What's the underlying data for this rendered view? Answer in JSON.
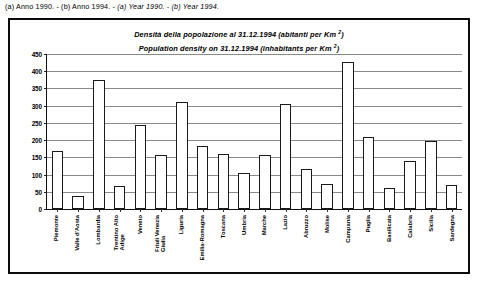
{
  "caption": {
    "roman_part": "(a) Anno 1990. - (b) Anno 1994. - ",
    "italic_part": "(a) Year 1990. - (b) Year 1994."
  },
  "chart_data": {
    "type": "bar",
    "title_it": "Densità della popolazione al 31.12.1994 (abitanti per Km ²)",
    "title_en": "Population density on 31.12.1994 (inhabitants per Km ²)",
    "xlabel": "",
    "ylabel": "",
    "ylim": [
      0,
      450
    ],
    "ytick_step": 50,
    "grid": true,
    "legend_position": "none",
    "ytick_labels": [
      "450",
      "400",
      "350",
      "300",
      "250",
      "200",
      "150",
      "100",
      "50",
      "0"
    ],
    "categories": [
      "Piemonte",
      "Valle d'Aosta",
      "Lombardia",
      "Trentino Alto\nAdige",
      "Veneto",
      "Friuli Venezia\nGiulia",
      "Liguria",
      "Emilia-Romagna",
      "Toscana",
      "Umbria",
      "Marche",
      "Lazio",
      "Abruzzo",
      "Molise",
      "Campania",
      "Puglia",
      "Basilicata",
      "Calabria",
      "Sicilia",
      "Sardegna"
    ],
    "values": [
      168,
      38,
      375,
      68,
      244,
      156,
      312,
      182,
      159,
      106,
      156,
      305,
      117,
      74,
      428,
      208,
      61,
      138,
      198,
      69
    ]
  },
  "colors": {
    "frame": "#0b0b0b",
    "bar_fill": "#ffffff",
    "bar_stroke": "#1a1a1a",
    "grid": "#8a8a8a",
    "text": "#000000"
  }
}
